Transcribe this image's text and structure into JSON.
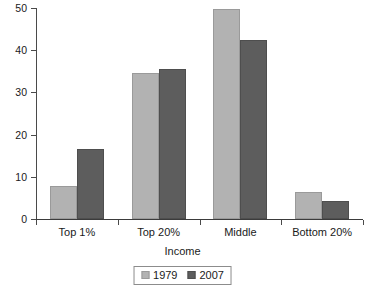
{
  "chart_data": {
    "type": "bar",
    "title": "",
    "subtitle": "",
    "xlabel": "Income",
    "ylabel": "",
    "categories": [
      "Top 1%",
      "Top 20%",
      "Middle",
      "Bottom 20%"
    ],
    "series": [
      {
        "name": "1979",
        "color": "#b2b2b2",
        "values": [
          7.8,
          34.7,
          49.7,
          6.5
        ]
      },
      {
        "name": "2007",
        "color": "#5d5d5d",
        "values": [
          16.7,
          35.5,
          42.4,
          4.3
        ]
      }
    ],
    "ylim": [
      0,
      50
    ],
    "yticks": [
      0,
      10,
      20,
      30,
      40,
      50
    ],
    "ytick_labels": [
      "0",
      "10",
      "20",
      "30",
      "40",
      "50"
    ],
    "grid": false,
    "legend_position": "bottom",
    "legend_entries": [
      "1979",
      "2007"
    ],
    "annotations": []
  }
}
